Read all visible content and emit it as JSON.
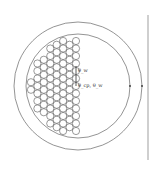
{
  "diagram": {
    "type": "cross-section of packed cylinders in a circular container",
    "labels": {
      "upper_label": "θ_w",
      "lower_label": "θ_cp, θ_w"
    },
    "geometry": {
      "outer_circle": {
        "cx": 78,
        "cy": 86,
        "r": 64
      },
      "inner_circle": {
        "cx": 78,
        "cy": 86,
        "r": 52
      },
      "wall_line_x": 148,
      "small_circle_r": 3.6,
      "columns": 7
    },
    "colors": {
      "stroke": "#555555",
      "background": "#ffffff"
    }
  }
}
